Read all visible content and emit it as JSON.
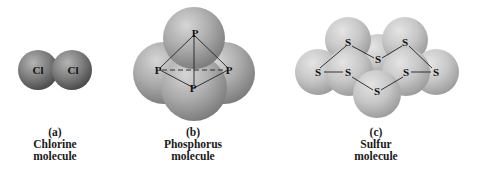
{
  "figure": {
    "panels": [
      {
        "letter": "(a)",
        "name": "Chlorine",
        "suffix": "molecule",
        "atom_symbol": "Cl",
        "atoms": [
          "Cl",
          "Cl"
        ]
      },
      {
        "letter": "(b)",
        "name": "Phosphorus",
        "suffix": "molecule",
        "atom_symbol": "P",
        "atoms": [
          "P",
          "P",
          "P",
          "P"
        ]
      },
      {
        "letter": "(c)",
        "name": "Sulfur",
        "suffix": "molecule",
        "atom_symbol": "S",
        "atoms": [
          "S",
          "S",
          "S",
          "S",
          "S",
          "S",
          "S",
          "S"
        ]
      }
    ],
    "colors": {
      "chlorine_sphere": "#7a7a7a",
      "phosphorus_sphere": "#a8a8a8",
      "sulfur_sphere": "#c4c4c4",
      "label_text": "#1a1a1a"
    }
  }
}
